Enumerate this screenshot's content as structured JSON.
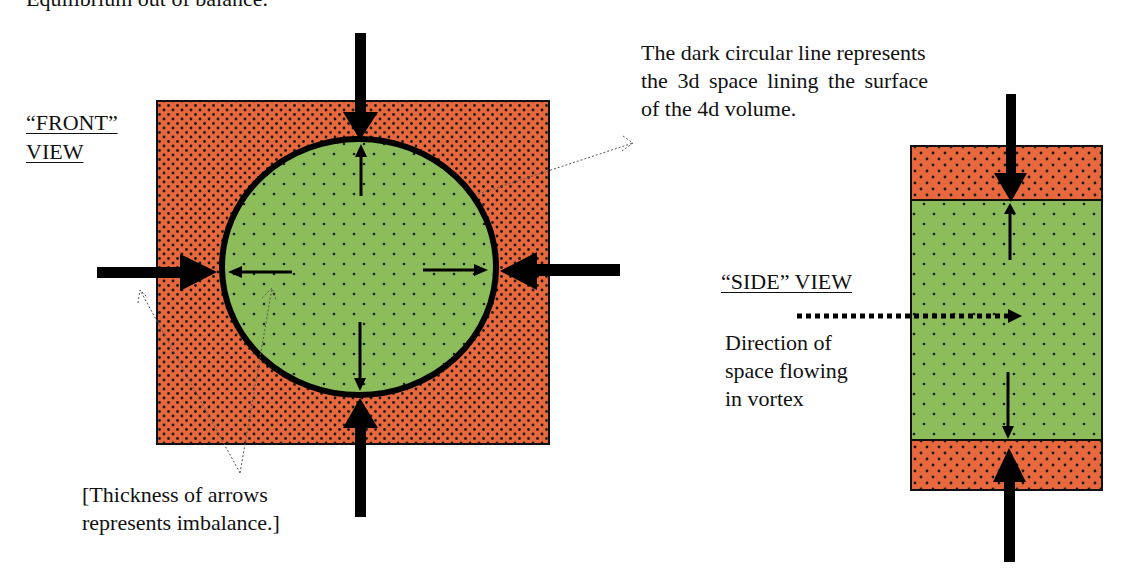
{
  "title": "Equilibrium out of balance.",
  "front_view": {
    "label_line1": "“FRONT”",
    "label_line2": "VIEW",
    "outer_color": "#e8683e",
    "inner_color": "#8cbd5a",
    "boundary_description_line1": "The dark circular line represents",
    "boundary_description_line2": "the 3d space lining the surface",
    "boundary_description_line3": "of the 4d volume.",
    "note_line1": "[Thickness of arrows",
    "note_line2": "represents imbalance.]"
  },
  "side_view": {
    "label": "“SIDE” VIEW",
    "flow_label_line1": "Direction of",
    "flow_label_line2": "space flowing",
    "flow_label_line3": "in vortex"
  },
  "colors": {
    "outer_region": "#e8683e",
    "inner_region": "#8cbd5a",
    "arrow": "#000000",
    "dots": "#1a1a1a"
  }
}
